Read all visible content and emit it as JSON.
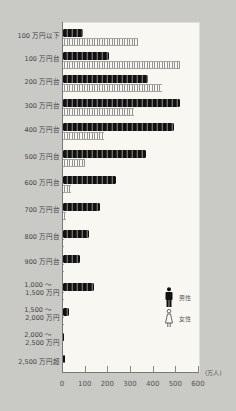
{
  "chart_data": {
    "type": "bar",
    "orientation": "horizontal",
    "title": "",
    "xlabel": "(万人)",
    "ylabel": "",
    "xlim": [
      0,
      600
    ],
    "xticks": [
      "0",
      "100",
      "200",
      "300",
      "400",
      "500",
      "600"
    ],
    "categories": [
      "100 万円以下",
      "100 万円台",
      "200 万円台",
      "300 万円台",
      "400 万円台",
      "500 万円台",
      "600 万円台",
      "700 万円台",
      "800 万円台",
      "900 万円台",
      "1,000 ～ 1,500 万円",
      "1,500 ～ 2,000 万円",
      "2,000 ～ 2,500 万円",
      "2,500 万円超"
    ],
    "series": [
      {
        "name": "男性",
        "values": [
          90,
          205,
          375,
          515,
          490,
          365,
          235,
          165,
          115,
          75,
          135,
          25,
          5,
          7
        ]
      },
      {
        "name": "女性",
        "values": [
          330,
          515,
          435,
          315,
          180,
          95,
          35,
          15,
          5,
          2,
          3,
          1,
          0,
          0
        ]
      }
    ],
    "legend": [
      "男性",
      "女性"
    ],
    "legend_position": "right-middle",
    "grid": false
  },
  "labels": {
    "cats": [
      {
        "l1": "100 万円以下",
        "l2": ""
      },
      {
        "l1": "100 万円台",
        "l2": ""
      },
      {
        "l1": "200 万円台",
        "l2": ""
      },
      {
        "l1": "300 万円台",
        "l2": ""
      },
      {
        "l1": "400 万円台",
        "l2": ""
      },
      {
        "l1": "500 万円台",
        "l2": ""
      },
      {
        "l1": "600 万円台",
        "l2": ""
      },
      {
        "l1": "700 万円台",
        "l2": ""
      },
      {
        "l1": "800 万円台",
        "l2": ""
      },
      {
        "l1": "900 万円台",
        "l2": ""
      },
      {
        "l1": "1,000 ～",
        "l2": "1,500 万円"
      },
      {
        "l1": "1,500 ～",
        "l2": "2,000 万円"
      },
      {
        "l1": "2,000 ～",
        "l2": "2,500 万円"
      },
      {
        "l1": "2,500 万円超",
        "l2": ""
      }
    ],
    "unit": "(万人)",
    "legend_male": "男性",
    "legend_female": "女性",
    "ticks": [
      "0",
      "100",
      "200",
      "300",
      "400",
      "500",
      "600"
    ]
  },
  "colors": {
    "male": "#111111",
    "female": "#888888",
    "background": "#c9c9c6",
    "panel": "#f8f7f1"
  }
}
